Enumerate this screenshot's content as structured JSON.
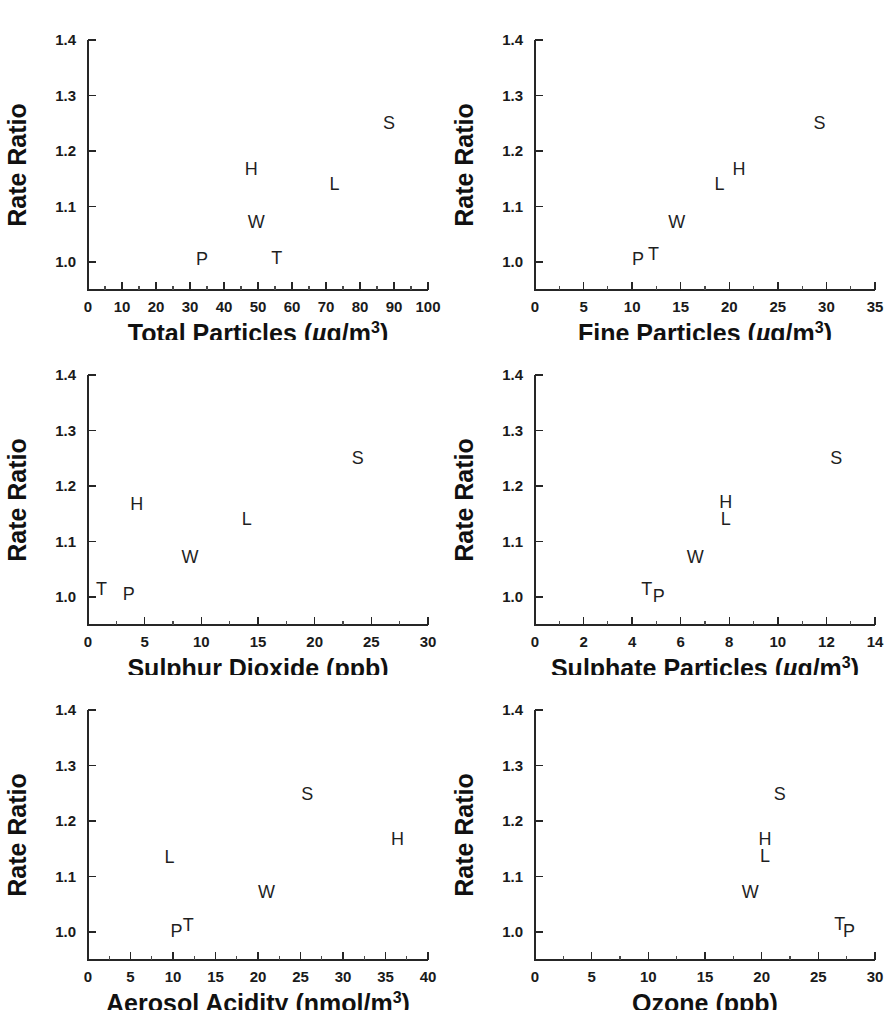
{
  "figure": {
    "background": "#ffffff",
    "marker_color": "#1f1f1f",
    "axis_color": "#262626",
    "y_axis_label": "Rate Ratio",
    "n_panels": 6,
    "layout": "3 rows x 2 columns"
  },
  "chart_data": [
    {
      "type": "scatter",
      "title": "",
      "xlabel": "Total Particles (µg/m³)",
      "xlabel_parts": {
        "name": "Total Particles",
        "unit_open": "(",
        "mu": "µ",
        "unit_body": "g/m",
        "sup": "3",
        "unit_close": ")"
      },
      "ylabel": "Rate Ratio",
      "xlim": [
        0,
        100
      ],
      "ylim": [
        0.95,
        1.4
      ],
      "xticks": [
        0,
        10,
        20,
        30,
        40,
        50,
        60,
        70,
        80,
        90,
        100
      ],
      "xticklabels": [
        "0",
        "10",
        "20",
        "30",
        "40",
        "50",
        "60",
        "70",
        "80",
        "90",
        "100"
      ],
      "yticks": [
        1.0,
        1.1,
        1.2,
        1.3,
        1.4
      ],
      "yticklabels": [
        "1.0",
        "1.1",
        "1.2",
        "1.3",
        "1.4"
      ],
      "x_minor_step": 5,
      "grid": false,
      "legend": "none",
      "points": [
        {
          "label": "P",
          "x": 33.5,
          "y": 1.005
        },
        {
          "label": "T",
          "x": 55.5,
          "y": 1.008
        },
        {
          "label": "W",
          "x": 49.5,
          "y": 1.072
        },
        {
          "label": "H",
          "x": 48.0,
          "y": 1.167
        },
        {
          "label": "L",
          "x": 72.5,
          "y": 1.14
        },
        {
          "label": "S",
          "x": 88.5,
          "y": 1.25
        }
      ]
    },
    {
      "type": "scatter",
      "title": "",
      "xlabel": "Fine Particles (µg/m³)",
      "xlabel_parts": {
        "name": "Fine Particles",
        "unit_open": "(",
        "mu": "µ",
        "unit_body": "g/m",
        "sup": "3",
        "unit_close": ")"
      },
      "ylabel": "Rate Ratio",
      "xlim": [
        0,
        35
      ],
      "ylim": [
        0.95,
        1.4
      ],
      "xticks": [
        0,
        5,
        10,
        15,
        20,
        25,
        30,
        35
      ],
      "xticklabels": [
        "0",
        "5",
        "10",
        "15",
        "20",
        "25",
        "30",
        "35"
      ],
      "yticks": [
        1.0,
        1.1,
        1.2,
        1.3,
        1.4
      ],
      "yticklabels": [
        "1.0",
        "1.1",
        "1.2",
        "1.3",
        "1.4"
      ],
      "x_minor_step": 2.5,
      "grid": false,
      "legend": "none",
      "points": [
        {
          "label": "P",
          "x": 10.6,
          "y": 1.005
        },
        {
          "label": "T",
          "x": 12.2,
          "y": 1.015
        },
        {
          "label": "W",
          "x": 14.6,
          "y": 1.072
        },
        {
          "label": "L",
          "x": 19.0,
          "y": 1.14
        },
        {
          "label": "H",
          "x": 21.0,
          "y": 1.167
        },
        {
          "label": "S",
          "x": 29.3,
          "y": 1.25
        }
      ]
    },
    {
      "type": "scatter",
      "title": "",
      "xlabel": "Sulphur Dioxide (ppb)",
      "xlabel_parts": {
        "name": "Sulphur Dioxide",
        "unit_open": "(",
        "mu": "",
        "unit_body": "ppb",
        "sup": "",
        "unit_close": ")"
      },
      "ylabel": "Rate Ratio",
      "xlim": [
        0,
        30
      ],
      "ylim": [
        0.95,
        1.4
      ],
      "xticks": [
        0,
        5,
        10,
        15,
        20,
        25,
        30
      ],
      "xticklabels": [
        "0",
        "5",
        "10",
        "15",
        "20",
        "25",
        "30"
      ],
      "yticks": [
        1.0,
        1.1,
        1.2,
        1.3,
        1.4
      ],
      "yticklabels": [
        "1.0",
        "1.1",
        "1.2",
        "1.3",
        "1.4"
      ],
      "x_minor_step": 2.5,
      "grid": false,
      "legend": "none",
      "points": [
        {
          "label": "T",
          "x": 1.2,
          "y": 1.015
        },
        {
          "label": "P",
          "x": 3.6,
          "y": 1.005
        },
        {
          "label": "W",
          "x": 9.0,
          "y": 1.072
        },
        {
          "label": "H",
          "x": 4.3,
          "y": 1.167
        },
        {
          "label": "L",
          "x": 14.0,
          "y": 1.14
        },
        {
          "label": "S",
          "x": 23.8,
          "y": 1.25
        }
      ]
    },
    {
      "type": "scatter",
      "title": "",
      "xlabel": "Sulphate Particles (µg/m³)",
      "xlabel_parts": {
        "name": "Sulphate Particles",
        "unit_open": "(",
        "mu": "µ",
        "unit_body": "g/m",
        "sup": "3",
        "unit_close": ")"
      },
      "ylabel": "Rate Ratio",
      "xlim": [
        0,
        14
      ],
      "ylim": [
        0.95,
        1.4
      ],
      "xticks": [
        0,
        2,
        4,
        6,
        8,
        10,
        12,
        14
      ],
      "xticklabels": [
        "0",
        "2",
        "4",
        "6",
        "8",
        "10",
        "12",
        "14"
      ],
      "yticks": [
        1.0,
        1.1,
        1.2,
        1.3,
        1.4
      ],
      "yticklabels": [
        "1.0",
        "1.1",
        "1.2",
        "1.3",
        "1.4"
      ],
      "x_minor_step": 1,
      "grid": false,
      "legend": "none",
      "points": [
        {
          "label": "T",
          "x": 4.6,
          "y": 1.015
        },
        {
          "label": "P",
          "x": 5.1,
          "y": 1.003
        },
        {
          "label": "W",
          "x": 6.6,
          "y": 1.072
        },
        {
          "label": "L",
          "x": 7.85,
          "y": 1.14
        },
        {
          "label": "H",
          "x": 7.85,
          "y": 1.172
        },
        {
          "label": "S",
          "x": 12.4,
          "y": 1.25
        }
      ]
    },
    {
      "type": "scatter",
      "title": "",
      "xlabel": "Aerosol Acidity (nmol/m³)",
      "xlabel_parts": {
        "name": "Aerosol Acidity",
        "unit_open": "(",
        "mu": "",
        "unit_body": "nmol/m",
        "sup": "3",
        "unit_close": ")"
      },
      "ylabel": "Rate Ratio",
      "xlim": [
        0,
        40
      ],
      "ylim": [
        0.95,
        1.4
      ],
      "xticks": [
        0,
        5,
        10,
        15,
        20,
        25,
        30,
        35,
        40
      ],
      "xticklabels": [
        "0",
        "5",
        "10",
        "15",
        "20",
        "25",
        "30",
        "35",
        "40"
      ],
      "yticks": [
        1.0,
        1.1,
        1.2,
        1.3,
        1.4
      ],
      "yticklabels": [
        "1.0",
        "1.1",
        "1.2",
        "1.3",
        "1.4"
      ],
      "x_minor_step": 2.5,
      "grid": false,
      "legend": "none",
      "points": [
        {
          "label": "P",
          "x": 10.4,
          "y": 1.003
        },
        {
          "label": "T",
          "x": 11.8,
          "y": 1.013
        },
        {
          "label": "L",
          "x": 9.6,
          "y": 1.135
        },
        {
          "label": "W",
          "x": 21.0,
          "y": 1.072
        },
        {
          "label": "S",
          "x": 25.8,
          "y": 1.248
        },
        {
          "label": "H",
          "x": 36.4,
          "y": 1.167
        }
      ]
    },
    {
      "type": "scatter",
      "title": "",
      "xlabel": "Ozone (ppb)",
      "xlabel_parts": {
        "name": "Ozone",
        "unit_open": "(",
        "mu": "",
        "unit_body": "ppb",
        "sup": "",
        "unit_close": ")"
      },
      "ylabel": "Rate Ratio",
      "xlim": [
        0,
        30
      ],
      "ylim": [
        0.95,
        1.4
      ],
      "xticks": [
        0,
        5,
        10,
        15,
        20,
        25,
        30
      ],
      "xticklabels": [
        "0",
        "5",
        "10",
        "15",
        "20",
        "25",
        "30"
      ],
      "yticks": [
        1.0,
        1.1,
        1.2,
        1.3,
        1.4
      ],
      "yticklabels": [
        "1.0",
        "1.1",
        "1.2",
        "1.3",
        "1.4"
      ],
      "x_minor_step": 2.5,
      "grid": false,
      "legend": "none",
      "points": [
        {
          "label": "W",
          "x": 19.0,
          "y": 1.072
        },
        {
          "label": "L",
          "x": 20.3,
          "y": 1.138
        },
        {
          "label": "H",
          "x": 20.3,
          "y": 1.168
        },
        {
          "label": "S",
          "x": 21.6,
          "y": 1.248
        },
        {
          "label": "T",
          "x": 26.9,
          "y": 1.015
        },
        {
          "label": "P",
          "x": 27.7,
          "y": 1.003
        }
      ]
    }
  ]
}
